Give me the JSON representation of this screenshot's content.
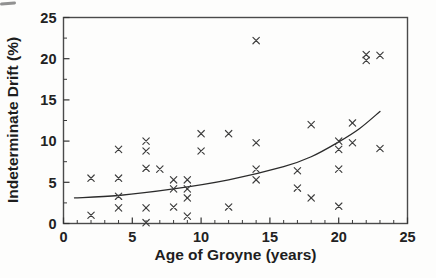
{
  "figure": {
    "background": "#fdfdfc",
    "ink": "#2a2a2a"
  },
  "chart_data": {
    "type": "scatter",
    "title": "",
    "xlabel": "Age of Groyne (years)",
    "ylabel": "Indeterminate Drift (%)",
    "xlim": [
      0,
      25
    ],
    "ylim": [
      0,
      25
    ],
    "x_major_ticks": [
      0,
      5,
      10,
      15,
      20,
      25
    ],
    "y_major_ticks": [
      0,
      5,
      10,
      15,
      20,
      25
    ],
    "x_minor_step": 1,
    "y_minor_step": 2.5,
    "grid": false,
    "legend": "none",
    "marker": "x",
    "marker_color": "#3d3d3d",
    "trend_color": "#2b2b2b",
    "frame_color": "#4a4a4a",
    "points": [
      [
        2,
        5.5
      ],
      [
        2,
        1.0
      ],
      [
        4,
        9.0
      ],
      [
        4,
        5.5
      ],
      [
        4,
        3.3
      ],
      [
        4,
        1.9
      ],
      [
        6,
        10.0
      ],
      [
        6,
        8.8
      ],
      [
        6,
        6.7
      ],
      [
        6,
        1.9
      ],
      [
        6,
        0.1
      ],
      [
        7,
        6.6
      ],
      [
        8,
        5.3
      ],
      [
        8,
        4.2
      ],
      [
        8,
        2.0
      ],
      [
        9,
        5.3
      ],
      [
        9,
        4.2
      ],
      [
        9,
        3.1
      ],
      [
        9,
        0.9
      ],
      [
        10,
        10.9
      ],
      [
        10,
        8.8
      ],
      [
        12,
        10.9
      ],
      [
        12,
        2.0
      ],
      [
        14,
        22.2
      ],
      [
        14,
        9.8
      ],
      [
        14,
        6.6
      ],
      [
        14,
        5.3
      ],
      [
        17,
        6.4
      ],
      [
        17,
        4.3
      ],
      [
        18,
        12.0
      ],
      [
        18,
        3.1
      ],
      [
        20,
        10.0
      ],
      [
        20,
        9.0
      ],
      [
        20,
        6.6
      ],
      [
        20,
        2.1
      ],
      [
        21,
        12.2
      ],
      [
        21,
        9.8
      ],
      [
        22,
        20.5
      ],
      [
        22,
        19.8
      ],
      [
        23,
        20.4
      ],
      [
        23,
        9.1
      ]
    ],
    "trend_line": [
      [
        0.8,
        3.1
      ],
      [
        4,
        3.4
      ],
      [
        8,
        4.2
      ],
      [
        12,
        5.3
      ],
      [
        16,
        6.9
      ],
      [
        18,
        8.1
      ],
      [
        20,
        9.9
      ],
      [
        21.5,
        11.5
      ],
      [
        23,
        13.6
      ]
    ]
  }
}
